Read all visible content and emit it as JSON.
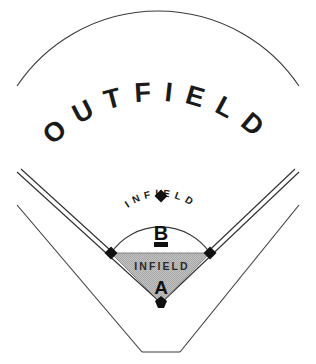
{
  "diagram": {
    "regions": {
      "outfield": {
        "label": "OUTFIELD",
        "letters": [
          "O",
          "U",
          "T",
          "F",
          "I",
          "E",
          "L",
          "D"
        ]
      },
      "infield_outer": {
        "label": "INFIELD",
        "letters": [
          "I",
          "N",
          "F",
          "I",
          "E",
          "L",
          "D"
        ],
        "zone_letter": "B"
      },
      "infield_inner": {
        "label": "INFIELD",
        "zone_letter": "A"
      }
    },
    "bases": [
      {
        "name": "home-plate",
        "cx": 161,
        "cy": 303
      },
      {
        "name": "first-base",
        "cx": 210,
        "cy": 253
      },
      {
        "name": "second-base",
        "cx": 161,
        "cy": 196
      },
      {
        "name": "third-base",
        "cx": 111,
        "cy": 253
      }
    ],
    "pitchers-rubber": {
      "cx": 161,
      "cy": 245
    },
    "colors": {
      "line": "#3a3a3a",
      "infield_fill": "#b9b9b9",
      "text": "#1a1a1a",
      "background": "#ffffff"
    }
  }
}
